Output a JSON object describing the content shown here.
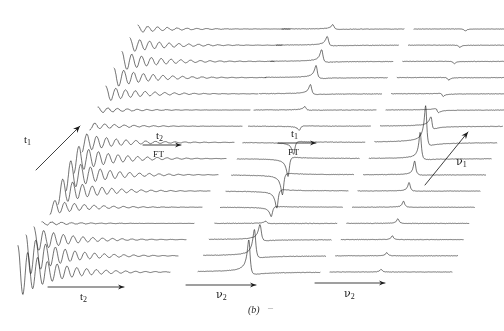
{
  "figure": {
    "caption": "(b)",
    "caption_trailing_mark": "–",
    "background_color": "#ffffff",
    "ink_color": "#1c1c1c",
    "width": 504,
    "height": 331
  },
  "chart_data": {
    "type": "line",
    "title": "",
    "subtitle": "",
    "grid": false,
    "legend": false,
    "n_panels": 3,
    "panels": [
      {
        "id": "panel-time-domain",
        "index": 0,
        "stage": "time-domain",
        "domain_x": "t2",
        "domain_y": "t1",
        "x_axis_label": "t2",
        "x_axis_label_text": "t",
        "x_axis_label_sub": "2",
        "diagonal_axis_label_text": "t",
        "diagonal_axis_label_sub": "1",
        "n_traces": 16,
        "trace_type": "damped-oscillation",
        "origin_x": 18,
        "origin_y": 272,
        "trace_length": 152,
        "stack_dx": 8.0,
        "stack_dy": -16.2,
        "samples": 300,
        "signal": {
          "v2_frequency_hz": 15.5,
          "t2_decay_rate": 4.6,
          "amplitude": 26,
          "v1_frequency_hz": 1.18,
          "v1_phase": 0.0,
          "noise": 0.35
        }
      },
      {
        "id": "panel-mixed-domain",
        "index": 1,
        "stage": "mixed-domain",
        "domain_x": "v2",
        "domain_y": "t1",
        "x_axis_label": "v2",
        "x_axis_label_text": "ν",
        "x_axis_label_sub": "2",
        "n_traces": 16,
        "trace_type": "absorption-peak",
        "origin_x": 198,
        "origin_y": 272,
        "trace_length": 122,
        "stack_dx": 5.6,
        "stack_dy": -16.2,
        "samples": 300,
        "signal": {
          "peak_center_fraction": 0.42,
          "peak_width": 0.014,
          "amplitude": 30,
          "v1_frequency_hz": 1.18,
          "v1_phase": 0.0,
          "dispersive_mix": 0.55,
          "noise": 0.22
        }
      },
      {
        "id": "panel-frequency-domain",
        "index": 2,
        "stage": "frequency-domain",
        "domain_x": "v2",
        "domain_y": "v1",
        "x_axis_label": "v2",
        "x_axis_label_text": "ν",
        "x_axis_label_sub": "2",
        "diagonal_axis_label_text": "ν",
        "diagonal_axis_label_sub": "1",
        "n_traces": 16,
        "trace_type": "2d-peak",
        "origin_x": 330,
        "origin_y": 272,
        "trace_length": 122,
        "stack_dx": 5.6,
        "stack_dy": -16.2,
        "samples": 300,
        "signal": {
          "peak_center_fraction": 0.42,
          "peak_width": 0.012,
          "amplitude": 34,
          "v1_center_trace": 8,
          "v1_width_traces": 0.95,
          "dispersive_mix": 0.6,
          "noise": 0.2
        }
      }
    ],
    "arrows": [
      {
        "id": "arrow-t2-axis",
        "name": "t2-axis-arrow",
        "type": "horizontal-axis",
        "x1": 48,
        "y1": 287,
        "x2": 124,
        "y2": 287,
        "label_text": "t",
        "label_sub": "2",
        "label_x": 80,
        "label_y": 291
      },
      {
        "id": "arrow-v2-axis-mid",
        "name": "v2-axis-arrow-middle",
        "type": "horizontal-axis",
        "x1": 186,
        "y1": 285,
        "x2": 256,
        "y2": 285,
        "label_text": "ν",
        "label_sub": "2",
        "label_x": 216,
        "label_y": 289
      },
      {
        "id": "arrow-v2-axis-right",
        "name": "v2-axis-arrow-right",
        "type": "horizontal-axis",
        "x1": 315,
        "y1": 283,
        "x2": 385,
        "y2": 283,
        "label_text": "ν",
        "label_sub": "2",
        "label_x": 344,
        "label_y": 288
      },
      {
        "id": "arrow-t1-diagonal",
        "name": "t1-diagonal-arrow",
        "type": "diagonal-axis",
        "x1": 36,
        "y1": 170,
        "x2": 80,
        "y2": 126,
        "label_text": "t",
        "label_sub": "1",
        "label_x": 24,
        "label_y": 134
      },
      {
        "id": "arrow-v1-diagonal",
        "name": "v1-diagonal-arrow",
        "type": "diagonal-axis",
        "x1": 425,
        "y1": 185,
        "x2": 468,
        "y2": 132,
        "label_text": "ν",
        "label_sub": "1",
        "label_x": 456,
        "label_y": 156
      },
      {
        "id": "arrow-ft-t2",
        "name": "ft-t2-transform-arrow",
        "type": "transform",
        "x1": 143,
        "y1": 145,
        "x2": 181,
        "y2": 145,
        "label_above_text": "t",
        "label_above_sub": "2",
        "label_above_x": 156,
        "label_above_y": 130,
        "label_below": "FT",
        "label_below_x": 153,
        "label_below_y": 150
      },
      {
        "id": "arrow-ft-t1",
        "name": "ft-t1-transform-arrow",
        "type": "transform",
        "x1": 278,
        "y1": 143,
        "x2": 316,
        "y2": 143,
        "label_above_text": "t",
        "label_above_sub": "1",
        "label_above_x": 291,
        "label_above_y": 128,
        "label_below": "FT",
        "label_below_x": 288,
        "label_below_y": 148
      }
    ],
    "xlabel": "",
    "ylabel": "",
    "xlim": [
      0,
      504
    ],
    "ylim": [
      0,
      331
    ]
  }
}
